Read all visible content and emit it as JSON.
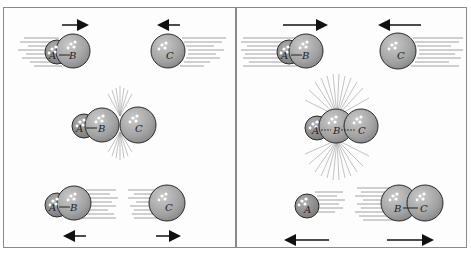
{
  "figure": {
    "colors": {
      "sphere_fill": "#a6a6a6",
      "sphere_small_fill": "#8e8e8e",
      "outline": "#2a2a2a",
      "motion_lines": "#7a7a7a",
      "arrow": "#111111",
      "panel_border": "#8a8a8a"
    }
  },
  "panels": [
    {
      "id": "left",
      "outcome": "unreactive collision",
      "rows": [
        {
          "stage": "before",
          "molecules": [
            "A—B",
            "C"
          ],
          "arrows": [
            "right",
            "left"
          ]
        },
        {
          "stage": "collision",
          "molecules": [
            "A—B C"
          ]
        },
        {
          "stage": "after",
          "molecules": [
            "A—B",
            "C"
          ],
          "arrows": [
            "left",
            "right"
          ]
        }
      ],
      "labels": {
        "a1": "A",
        "b1": "B",
        "c1": "C",
        "a2": "A",
        "b2": "B",
        "c2": "C",
        "a3": "A",
        "b3": "B",
        "c3": "C"
      }
    },
    {
      "id": "right",
      "outcome": "reactive collision",
      "rows": [
        {
          "stage": "before",
          "molecules": [
            "A—B",
            "C"
          ],
          "arrows": [
            "right",
            "left"
          ]
        },
        {
          "stage": "collision",
          "molecules": [
            "A—B—C"
          ]
        },
        {
          "stage": "after",
          "molecules": [
            "A",
            "B—C"
          ],
          "arrows": [
            "left",
            "right"
          ]
        }
      ],
      "labels": {
        "a1": "A",
        "b1": "B",
        "c1": "C",
        "a2": "A",
        "b2": "B",
        "c2": "C",
        "a3": "A",
        "b3": "B",
        "c3": "C"
      }
    }
  ]
}
